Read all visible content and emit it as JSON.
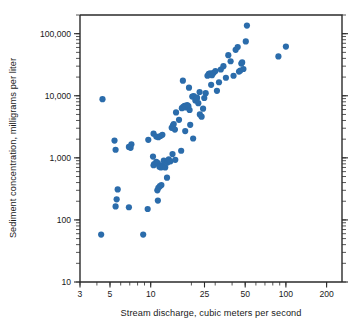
{
  "chart_data": {
    "type": "scatter",
    "title": "",
    "xlabel": "Stream discharge, cubic meters per second",
    "ylabel": "Sediment concentration, milligrams per liter",
    "xscale": "log",
    "yscale": "log",
    "xlim": [
      3,
      260
    ],
    "ylim": [
      10,
      200000
    ],
    "xticks": [
      3,
      5,
      10,
      25,
      50,
      100,
      200
    ],
    "xticklabels": [
      "3",
      "5",
      "10",
      "25",
      "50",
      "100",
      "200"
    ],
    "yticks": [
      10,
      100,
      1000,
      10000,
      100000
    ],
    "yticklabels": [
      "10",
      "100",
      "1,000",
      "10,000",
      "100,000"
    ],
    "grid": false,
    "legend": null,
    "marker_color": "#2b6cab",
    "marker_size": 3.1,
    "series": [
      {
        "name": "Sediment samples",
        "points": [
          [
            4.3,
            58
          ],
          [
            8.8,
            58
          ],
          [
            5.5,
            165
          ],
          [
            5.6,
            215
          ],
          [
            5.7,
            310
          ],
          [
            6.9,
            160
          ],
          [
            9.5,
            150
          ],
          [
            11.3,
            205
          ],
          [
            11.2,
            300
          ],
          [
            11.4,
            330
          ],
          [
            11.7,
            350
          ],
          [
            12.0,
            365
          ],
          [
            13.2,
            480
          ],
          [
            5.4,
            1900
          ],
          [
            5.5,
            1350
          ],
          [
            6.9,
            1500
          ],
          [
            7.1,
            1450
          ],
          [
            7.2,
            1650
          ],
          [
            9.6,
            1950
          ],
          [
            10.5,
            2450
          ],
          [
            11.0,
            2200
          ],
          [
            11.4,
            2150
          ],
          [
            11.8,
            2250
          ],
          [
            12.2,
            2350
          ],
          [
            10.4,
            1050
          ],
          [
            10.5,
            760
          ],
          [
            10.6,
            790
          ],
          [
            11.0,
            860
          ],
          [
            11.3,
            820
          ],
          [
            11.6,
            720
          ],
          [
            11.9,
            700
          ],
          [
            12.2,
            760
          ],
          [
            12.5,
            900
          ],
          [
            12.8,
            700
          ],
          [
            13.3,
            840
          ],
          [
            13.6,
            950
          ],
          [
            14.0,
            880
          ],
          [
            14.5,
            1150
          ],
          [
            15.2,
            930
          ],
          [
            16.8,
            1300
          ],
          [
            4.4,
            8800
          ],
          [
            14.3,
            3050
          ],
          [
            14.6,
            3300
          ],
          [
            14.8,
            3500
          ],
          [
            15.1,
            2850
          ],
          [
            15.4,
            5400
          ],
          [
            16.2,
            4100
          ],
          [
            17.3,
            17500
          ],
          [
            18.0,
            2700
          ],
          [
            19.2,
            13500
          ],
          [
            17.0,
            6300
          ],
          [
            17.4,
            6600
          ],
          [
            17.8,
            6900
          ],
          [
            18.2,
            6500
          ],
          [
            18.6,
            7100
          ],
          [
            19.0,
            6800
          ],
          [
            19.4,
            5900
          ],
          [
            20.3,
            9700
          ],
          [
            20.8,
            9900
          ],
          [
            21.4,
            8400
          ],
          [
            21.9,
            8900
          ],
          [
            22.5,
            7600
          ],
          [
            23.1,
            5000
          ],
          [
            23.8,
            4600
          ],
          [
            19.6,
            3400
          ],
          [
            20.6,
            2050
          ],
          [
            22.0,
            9300
          ],
          [
            23.0,
            11500
          ],
          [
            24.4,
            6200
          ],
          [
            24.9,
            9200
          ],
          [
            25.5,
            11000
          ],
          [
            26.3,
            21000
          ],
          [
            26.9,
            22500
          ],
          [
            27.6,
            23000
          ],
          [
            28.4,
            21500
          ],
          [
            29.2,
            23500
          ],
          [
            30.1,
            25000
          ],
          [
            30.9,
            12000
          ],
          [
            32.0,
            16500
          ],
          [
            33.0,
            26500
          ],
          [
            28.0,
            15000
          ],
          [
            34.5,
            30000
          ],
          [
            36.0,
            19500
          ],
          [
            37.5,
            45000
          ],
          [
            39.0,
            36000
          ],
          [
            41.0,
            21000
          ],
          [
            42.5,
            55000
          ],
          [
            44.0,
            61000
          ],
          [
            45.0,
            24500
          ],
          [
            46.0,
            25500
          ],
          [
            46.8,
            33000
          ],
          [
            47.5,
            34500
          ],
          [
            48.5,
            27000
          ],
          [
            50.5,
            75000
          ],
          [
            51.5,
            135000
          ],
          [
            88.0,
            43000
          ],
          [
            100.0,
            62000
          ]
        ]
      }
    ]
  },
  "layout": {
    "plot_left": 80,
    "plot_right": 342,
    "plot_top": 15,
    "plot_bottom": 282
  }
}
